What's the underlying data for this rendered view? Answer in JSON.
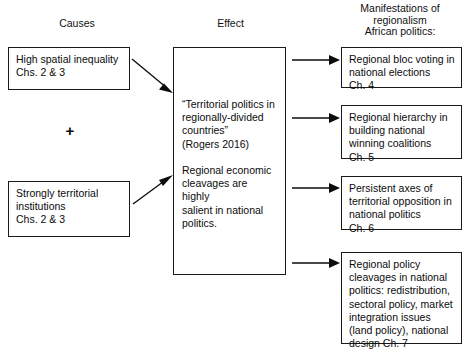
{
  "headers": {
    "causes": "Causes",
    "effect": "Effect",
    "manifestations": "Manifestations of\nregionalism\nAfrican politics:"
  },
  "causes": {
    "plus_symbol": "+",
    "boxes": [
      {
        "text": "High spatial inequality\nChs. 2 & 3"
      },
      {
        "text": "Strongly territorial\ninstitutions\nChs. 2 & 3"
      }
    ]
  },
  "effect": {
    "box": {
      "text": "“Territorial politics in\nregionally-divided\ncountries”\n(Rogers 2016)\n\nRegional economic\ncleavages are highly\nsalient in national\npolitics."
    }
  },
  "manifestations": {
    "boxes": [
      {
        "text": "Regional bloc voting in\nnational elections\nCh. 4"
      },
      {
        "text": "Regional hierarchy in\nbuilding national\nwinning coalitions\nCh. 5"
      },
      {
        "text": "Persistent axes of\nterritorial opposition in\nnational politics\nCh. 6"
      },
      {
        "text": "Regional policy\ncleavages in national\npolitics: redistribution,\nsectoral policy, market\nintegration issues\n(land policy), national\ndesign Ch. 7"
      }
    ]
  },
  "colors": {
    "background": "#ffffff",
    "text": "#0b0b0b",
    "border": "#1a1a1a",
    "arrow": "#0b0b0b"
  }
}
